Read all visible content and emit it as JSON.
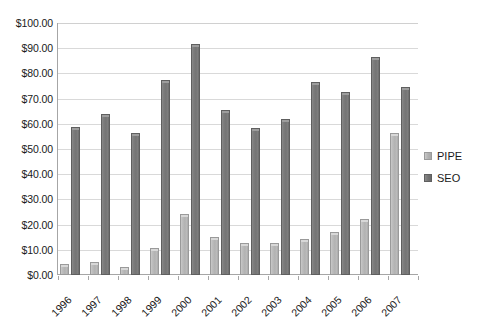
{
  "chart_data": {
    "type": "bar",
    "title": "",
    "subtitle": "",
    "xlabel": "",
    "ylabel": "",
    "categories": [
      "1996",
      "1997",
      "1998",
      "1999",
      "2000",
      "2001",
      "2002",
      "2003",
      "2004",
      "2005",
      "2006",
      "2007"
    ],
    "series": [
      {
        "name": "PIPE",
        "color": "#b2b2b2",
        "values": [
          4.3,
          5.0,
          3.2,
          10.6,
          24.4,
          15.0,
          12.7,
          12.6,
          14.1,
          17.1,
          22.3,
          56.3
        ]
      },
      {
        "name": "SEO",
        "color": "#747474",
        "values": [
          58.8,
          64.0,
          56.5,
          77.3,
          91.6,
          65.3,
          58.5,
          61.8,
          76.7,
          72.6,
          86.5,
          74.8
        ]
      }
    ],
    "ylim": [
      0,
      100
    ],
    "ytick_step": 10,
    "ytick_labels": [
      "$0.00",
      "$10.00",
      "$20.00",
      "$30.00",
      "$40.00",
      "$50.00",
      "$60.00",
      "$70.00",
      "$80.00",
      "$90.00",
      "$100.00"
    ],
    "ytick_values": [
      0,
      10,
      20,
      30,
      40,
      50,
      60,
      70,
      80,
      90,
      100
    ],
    "grid": true,
    "grid_axis": "y",
    "legend_position": "right",
    "legend_entries": [
      "PIPE",
      "SEO"
    ],
    "xtick_rotation": -45,
    "colors": {
      "pipe": "#b2b2b2",
      "seo": "#747474",
      "grid": "#d9d9d9",
      "axis": "#a6a6a6",
      "text": "#1a1a1a",
      "background": "#ffffff"
    }
  }
}
